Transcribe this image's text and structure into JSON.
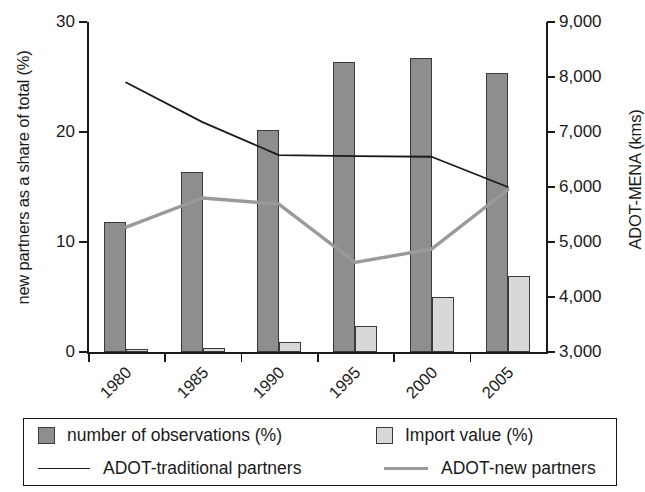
{
  "axes": {
    "left_title": "new partners as a share of total (%)",
    "right_title": "ADOT-MENA (kms)",
    "left_ticks": [
      "0",
      "10",
      "20",
      "30"
    ],
    "right_ticks": [
      "3,000",
      "4,000",
      "5,000",
      "6,000",
      "7,000",
      "8,000",
      "9,000"
    ],
    "x_ticks": [
      "1980",
      "1985",
      "1990",
      "1995",
      "2000",
      "2005"
    ]
  },
  "legend": {
    "items": [
      {
        "label": "number of observations (%)",
        "marker": "square-dark-swatch",
        "color": "#8e8e8e"
      },
      {
        "label": "Import value (%)",
        "marker": "square-light-swatch",
        "color": "#d8d8d8"
      },
      {
        "label": "ADOT-traditional partners",
        "marker": "line-black-swatch",
        "color": "#1a1a1a"
      },
      {
        "label": "ADOT-new partners",
        "marker": "line-gray-swatch",
        "color": "#9a9a9a"
      }
    ]
  },
  "chart_data": {
    "type": "bar",
    "title": "",
    "xlabel": "",
    "ylabel": "new partners as a share of total (%)",
    "y2label": "ADOT-MENA (kms)",
    "categories": [
      "1980",
      "1985",
      "1990",
      "1995",
      "2000",
      "2005"
    ],
    "ylim": [
      0,
      30
    ],
    "y2lim": [
      3000,
      9000
    ],
    "grid": false,
    "legend_position": "bottom",
    "series": [
      {
        "name": "number of observations (%)",
        "type": "bar",
        "axis": "left",
        "color": "#8e8e8e",
        "values": [
          11.8,
          16.4,
          20.2,
          26.4,
          26.7,
          25.4
        ]
      },
      {
        "name": "Import value (%)",
        "type": "bar",
        "axis": "left",
        "color": "#d8d8d8",
        "values": [
          0.3,
          0.4,
          0.9,
          2.4,
          5.0,
          6.9
        ]
      },
      {
        "name": "ADOT-traditional partners",
        "type": "line",
        "axis": "right",
        "color": "#1a1a1a",
        "values": [
          7900,
          7180,
          6580,
          6560,
          6550,
          6000
        ]
      },
      {
        "name": "ADOT-new partners",
        "type": "line",
        "axis": "right",
        "color": "#9a9a9a",
        "values": [
          5270,
          5800,
          5690,
          4630,
          4870,
          5950
        ]
      }
    ]
  }
}
